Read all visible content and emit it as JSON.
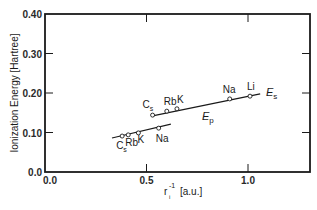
{
  "chart_data": {
    "type": "line",
    "title": "",
    "xlabel": "r_i^-1 [a.u.]",
    "ylabel": "Ionization Energy [Hartree]",
    "xlim": [
      0.0,
      1.3
    ],
    "ylim": [
      0.0,
      0.4
    ],
    "x_ticks": [
      {
        "value": 0.0,
        "label": "0.0"
      },
      {
        "value": 0.5,
        "label": "0.5"
      },
      {
        "value": 1.0,
        "label": "1.0"
      }
    ],
    "y_ticks": [
      {
        "value": 0.0,
        "label": "0.0"
      },
      {
        "value": 0.1,
        "label": "0.10"
      },
      {
        "value": 0.2,
        "label": "0.20"
      },
      {
        "value": 0.3,
        "label": "0.30"
      },
      {
        "value": 0.4,
        "label": "0.40"
      }
    ],
    "grid": false,
    "legend": "inline labels",
    "series": [
      {
        "name": "E_s",
        "label_main": "E",
        "label_sub": "s",
        "fit_line": [
          [
            0.53,
            0.142
          ],
          [
            1.06,
            0.198
          ]
        ],
        "points": [
          {
            "element": "Cs",
            "x": 0.53,
            "y": 0.144
          },
          {
            "element": "Rb",
            "x": 0.6,
            "y": 0.154
          },
          {
            "element": "K",
            "x": 0.65,
            "y": 0.16
          },
          {
            "element": "Na",
            "x": 0.91,
            "y": 0.185
          },
          {
            "element": "Li",
            "x": 1.01,
            "y": 0.192
          }
        ]
      },
      {
        "name": "E_p",
        "label_main": "E",
        "label_sub": "p",
        "fit_line": [
          [
            0.33,
            0.086
          ],
          [
            0.62,
            0.121
          ]
        ],
        "points": [
          {
            "element": "Cs",
            "x": 0.38,
            "y": 0.091
          },
          {
            "element": "Rb",
            "x": 0.41,
            "y": 0.094
          },
          {
            "element": "K",
            "x": 0.46,
            "y": 0.099
          },
          {
            "element": "Na",
            "x": 0.56,
            "y": 0.111
          }
        ]
      }
    ]
  },
  "labels": {
    "y_axis": "Ionization Energy [Hartree]",
    "x_axis_r": "r",
    "x_axis_sub": "i",
    "x_axis_sup": "-1",
    "x_axis_unit": "[a.u.]"
  }
}
